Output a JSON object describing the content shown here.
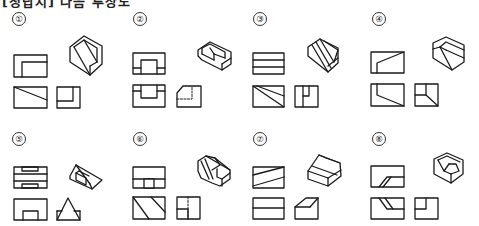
{
  "heading": "[정답지] 다음 투상도",
  "problems": [
    {
      "number": "①",
      "label": "1"
    },
    {
      "number": "②",
      "label": "2"
    },
    {
      "number": "③",
      "label": "3"
    },
    {
      "number": "④",
      "label": "4"
    },
    {
      "number": "⑤",
      "label": "5"
    },
    {
      "number": "⑥",
      "label": "6"
    },
    {
      "number": "⑦",
      "label": "7"
    },
    {
      "number": "⑧",
      "label": "8"
    }
  ],
  "colors": {
    "line": "#1a1a1a",
    "background": "#ffffff"
  }
}
